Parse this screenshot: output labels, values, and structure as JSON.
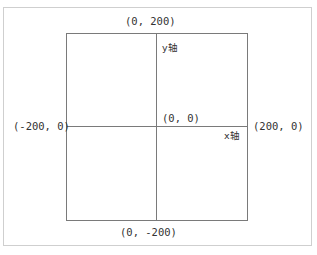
{
  "diagram": {
    "title": "",
    "points": {
      "top": "(0, 200)",
      "bottom": "(0, -200)",
      "left": "(-200, 0)",
      "right": "(200, 0)",
      "origin": "(0, 0)"
    },
    "axes": {
      "y_label": "y轴",
      "x_label": "x轴"
    },
    "colors": {
      "line": "#7a7a7a",
      "text": "#333333",
      "frame": "#cfcfcf"
    }
  }
}
